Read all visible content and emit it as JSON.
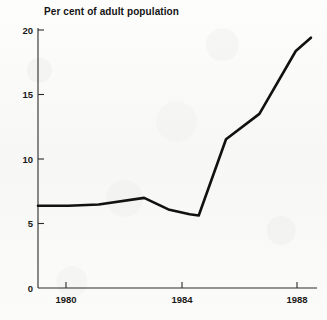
{
  "chart_data": {
    "type": "line",
    "title": "Per cent of adult population",
    "xlabel": "",
    "ylabel": "",
    "xlim": [
      1979,
      1988.2
    ],
    "ylim": [
      0,
      21.5
    ],
    "grid": false,
    "legend": "none",
    "x_ticks": [
      1980,
      1984,
      1988
    ],
    "x_tick_labels": [
      "1980",
      "1984",
      "1988"
    ],
    "y_ticks": [
      0,
      5,
      10,
      15,
      20
    ],
    "y_tick_labels": [
      "0",
      "5",
      "10",
      "15",
      "20"
    ],
    "series": [
      {
        "name": "Per cent of adult population",
        "color": "#111111",
        "x": [
          1979.0,
          1980.0,
          1981.0,
          1982.5,
          1983.3,
          1984.0,
          1984.3,
          1985.2,
          1986.3,
          1987.5,
          1988.0
        ],
        "values": [
          6.8,
          6.8,
          6.9,
          7.45,
          6.5,
          6.1,
          6.0,
          12.3,
          14.4,
          19.6,
          20.7
        ]
      }
    ],
    "annotations": []
  },
  "axes": {
    "y_axis_name": "y-axis",
    "x_axis_name": "x-axis"
  }
}
